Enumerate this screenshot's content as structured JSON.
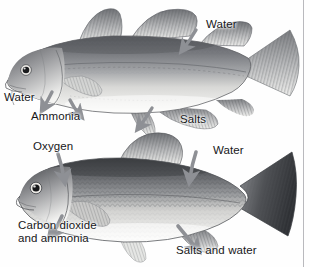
{
  "figure": {
    "background_color": "#fefefe",
    "text_color": "#17171a",
    "arrow_color": "#8e9095",
    "rule_color": "#b9b9bd",
    "width": 310,
    "height": 267
  },
  "fish": [
    {
      "id": "saltwater-cod",
      "common_name": "cod",
      "habitat": "saltwater",
      "body_fill_top": "#6f7175",
      "body_fill_belly": "#f2f2f0",
      "tail_shape": "square",
      "dorsal_fin_count": 3
    },
    {
      "id": "freshwater-carp",
      "common_name": "carp",
      "habitat": "freshwater",
      "body_fill_top": "#55575b",
      "body_fill_belly": "#f6f6f4",
      "tail_shape": "forked",
      "dorsal_fin_count": 1
    }
  ],
  "labels": [
    {
      "id": "cod-water-right",
      "text": "Water",
      "fish": "saltwater-cod",
      "direction": "in",
      "x": 206,
      "y": 24
    },
    {
      "id": "cod-water-left",
      "text": "Water",
      "fish": "saltwater-cod",
      "direction": "out",
      "x": 6,
      "y": 97
    },
    {
      "id": "cod-ammonia",
      "text": "Ammonia",
      "fish": "saltwater-cod",
      "direction": "out",
      "x": 33,
      "y": 115
    },
    {
      "id": "cod-salts",
      "text": "Salts",
      "fish": "saltwater-cod",
      "direction": "out",
      "x": 183,
      "y": 118
    },
    {
      "id": "carp-oxygen",
      "text": "Oxygen",
      "fish": "freshwater-carp",
      "direction": "in",
      "x": 35,
      "y": 146
    },
    {
      "id": "carp-water",
      "text": "Water",
      "fish": "freshwater-carp",
      "direction": "in",
      "x": 215,
      "y": 150
    },
    {
      "id": "carp-co2-line1",
      "text": "Carbon dioxide",
      "fish": "freshwater-carp",
      "direction": "out",
      "x": 20,
      "y": 225
    },
    {
      "id": "carp-co2-line2",
      "text": "and ammonia",
      "fish": "freshwater-carp",
      "direction": "out",
      "x": 20,
      "y": 238
    },
    {
      "id": "carp-salts-water",
      "text": "Salts and water",
      "fish": "freshwater-carp",
      "direction": "out",
      "x": 178,
      "y": 250
    }
  ]
}
